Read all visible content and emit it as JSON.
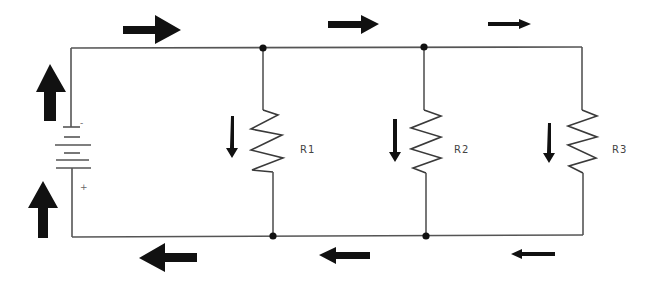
{
  "diagram": {
    "title": "",
    "type": "parallel-resistor-circuit-current-flow",
    "components": {
      "battery": {
        "negative_label": "-",
        "positive_label": "+"
      },
      "resistors": [
        {
          "label": "R1"
        },
        {
          "label": "R2"
        },
        {
          "label": "R3"
        }
      ]
    },
    "current_arrows": {
      "top_wire": [
        "right-large",
        "right-medium",
        "right-small"
      ],
      "bottom_wire": [
        "left-large",
        "left-medium",
        "left-small"
      ],
      "battery_side": [
        "up",
        "up"
      ],
      "branches": [
        "down",
        "down",
        "down"
      ]
    },
    "colors": {
      "wire": "#555555",
      "arrow": "#111111",
      "background": "#ffffff"
    }
  }
}
